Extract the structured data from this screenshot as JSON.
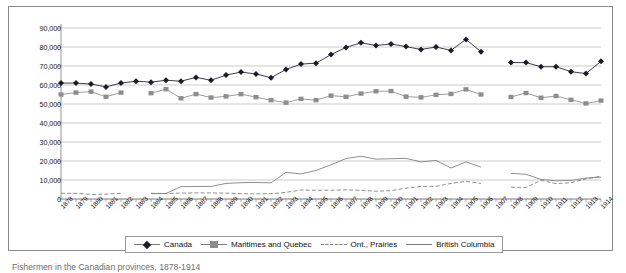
{
  "caption": "Fishermen in the Canadian provinces, 1878-1914",
  "legend": {
    "items": [
      {
        "label": "Canada",
        "marker": "diamond-marker"
      },
      {
        "label": "Maritimes and Quebec",
        "marker": "square-marker"
      },
      {
        "label": "Ont., Prairies",
        "marker": "dashed-line-marker"
      },
      {
        "label": "British Columbia",
        "marker": "solid-line-marker"
      }
    ]
  },
  "chart_data": {
    "type": "line",
    "title": "",
    "xlabel": "",
    "ylabel": "",
    "ylim": [
      0,
      90000
    ],
    "yticks": [
      0,
      10000,
      20000,
      30000,
      40000,
      50000,
      60000,
      70000,
      80000,
      90000
    ],
    "ytick_labels": [
      "0",
      "10,000",
      "20,000",
      "30,000",
      "40,000",
      "50,000",
      "60,000",
      "70,000",
      "80,000",
      "90,000"
    ],
    "grid": true,
    "legend_position": "bottom",
    "categories": [
      "1878",
      "1879",
      "1880",
      "1881",
      "1882",
      "1883",
      "1884",
      "1885",
      "1886",
      "1887",
      "1888",
      "1889",
      "1890",
      "1891",
      "1892",
      "1893",
      "1894",
      "1895",
      "1896",
      "1897",
      "1898",
      "1899",
      "1900",
      "1901",
      "1902",
      "1903",
      "1904",
      "1905",
      "1906",
      "1907",
      "1908",
      "1909",
      "1910",
      "1911",
      "1912",
      "1913",
      "1914"
    ],
    "series": [
      {
        "name": "Canada",
        "marker": "diamond",
        "color": "#1c1c28",
        "values": [
          61000,
          61000,
          60500,
          59000,
          61000,
          62000,
          61500,
          62500,
          62000,
          64000,
          62500,
          65200,
          66800,
          65800,
          63800,
          68200,
          71000,
          71500,
          76000,
          79800,
          82200,
          80800,
          81600,
          80200,
          78700,
          80000,
          78200,
          84000,
          77500,
          null,
          71800,
          71800,
          69600,
          69600,
          67000,
          66000,
          72500
        ]
      },
      {
        "name": "Maritimes and Quebec",
        "marker": "square",
        "color": "#8d8d8d",
        "values": [
          55000,
          56000,
          56500,
          53800,
          56000,
          null,
          55700,
          57800,
          53000,
          55200,
          53400,
          54000,
          55200,
          53600,
          52000,
          50700,
          52700,
          52000,
          54400,
          53800,
          55500,
          56700,
          56800,
          53900,
          53500,
          54800,
          55300,
          57700,
          55000,
          null,
          53700,
          55800,
          53300,
          54200,
          52200,
          50300,
          51800
        ]
      },
      {
        "name": "Ont., Prairies",
        "marker": "none",
        "style": "dashed",
        "color": "#7b7b7b",
        "values": [
          3000,
          3000,
          2400,
          2600,
          3000,
          null,
          3000,
          2900,
          3100,
          3200,
          3200,
          3100,
          2800,
          2700,
          2800,
          3500,
          4700,
          4600,
          4600,
          4800,
          4600,
          4100,
          4400,
          5700,
          6600,
          6700,
          8200,
          9300,
          8200,
          null,
          6200,
          6100,
          9800,
          8100,
          8600,
          10600,
          12000
        ]
      },
      {
        "name": "British Columbia",
        "marker": "none",
        "style": "solid",
        "color": "#7b7b7b",
        "values": [
          null,
          null,
          null,
          null,
          null,
          null,
          2800,
          2900,
          6500,
          6600,
          6600,
          8200,
          8600,
          8700,
          8500,
          14000,
          13200,
          15000,
          18000,
          21300,
          22500,
          21000,
          21200,
          21400,
          19500,
          20300,
          16300,
          19500,
          16800,
          null,
          13500,
          13000,
          10300,
          9600,
          9800,
          11000,
          11500
        ]
      }
    ]
  }
}
